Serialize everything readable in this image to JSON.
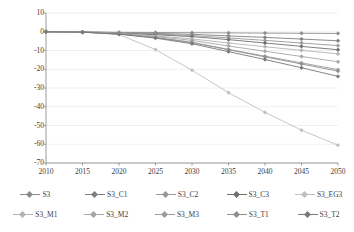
{
  "chart_data": {
    "type": "line",
    "title": "",
    "subtitle": "",
    "xlabel": "",
    "ylabel": "(Unit: Mt)",
    "x": [
      2010,
      2015,
      2020,
      2025,
      2030,
      2035,
      2040,
      2045,
      2050
    ],
    "xtick_labels": [
      "2010",
      "2015",
      "2020",
      "2025",
      "2030",
      "2035",
      "2040",
      "2045",
      "2050"
    ],
    "ytick_labels": [
      "10",
      "0",
      "-10",
      "-20",
      "-30",
      "-40",
      "-50",
      "-60",
      "-70"
    ],
    "ytick_values": [
      10,
      0,
      -10,
      -20,
      -30,
      -40,
      -50,
      -60,
      -70
    ],
    "xlim": [
      2010,
      2050
    ],
    "ylim": [
      -70,
      10
    ],
    "grid": "horizontal-light",
    "legend_position": "bottom",
    "legend_columns": 5,
    "marker": "diamond",
    "series": [
      {
        "name": "S3",
        "color": "#8c8c8c",
        "values": [
          0,
          -0.1,
          -0.3,
          -0.4,
          -0.5,
          -0.6,
          -0.7,
          -0.8,
          -0.9
        ]
      },
      {
        "name": "S3_C1",
        "color": "#7f7f7f",
        "values": [
          0,
          -0.1,
          -0.5,
          -0.9,
          -1.4,
          -2.2,
          -3.0,
          -3.9,
          -4.8
        ]
      },
      {
        "name": "S3_C2",
        "color": "#999999",
        "values": [
          0,
          -0.1,
          -0.6,
          -1.2,
          -2.0,
          -3.3,
          -4.6,
          -6.0,
          -7.4
        ]
      },
      {
        "name": "S3_C3",
        "color": "#707070",
        "values": [
          0,
          -0.2,
          -0.8,
          -1.6,
          -2.6,
          -4.2,
          -6.0,
          -7.8,
          -9.6
        ]
      },
      {
        "name": "S3_EG3",
        "color": "#bfbfbf",
        "values": [
          0,
          -0.2,
          -1.5,
          -9.5,
          -20.5,
          -32.5,
          -43.0,
          -52.5,
          -60.5
        ]
      },
      {
        "name": "S3_M1",
        "color": "#b3b3b3",
        "values": [
          0,
          -0.1,
          -0.9,
          -2.2,
          -3.8,
          -6.0,
          -8.0,
          -9.9,
          -11.8
        ]
      },
      {
        "name": "S3_M2",
        "color": "#a6a6a6",
        "values": [
          0,
          -0.2,
          -1.1,
          -2.6,
          -4.6,
          -7.6,
          -10.4,
          -13.2,
          -16.0
        ]
      },
      {
        "name": "S3_M3",
        "color": "#9c9c9c",
        "values": [
          0,
          -0.2,
          -1.2,
          -3.0,
          -5.6,
          -9.4,
          -13.0,
          -16.6,
          -20.2
        ]
      },
      {
        "name": "S3_T1",
        "color": "#8f8f8f",
        "values": [
          0,
          -0.2,
          -1.2,
          -3.1,
          -5.8,
          -9.6,
          -13.4,
          -17.2,
          -21.0
        ]
      },
      {
        "name": "S3_T2",
        "color": "#787878",
        "values": [
          0,
          -0.2,
          -1.3,
          -3.4,
          -6.4,
          -10.6,
          -14.8,
          -19.2,
          -23.8
        ]
      }
    ]
  },
  "legend": {
    "row1": [
      "S3",
      "S3_C1",
      "S3_C2",
      "S3_C3",
      "S3_EG3"
    ],
    "row2": [
      "S3_M1",
      "S3_M2",
      "S3_M3",
      "S3_T1",
      "S3_T2"
    ]
  }
}
